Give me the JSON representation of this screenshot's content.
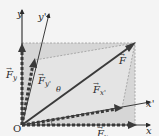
{
  "figure": {
    "origin_label": "O",
    "axes": {
      "x": "x",
      "y": "y",
      "x_prime": "x'",
      "y_prime": "y'"
    },
    "vectors": {
      "F": "F",
      "Fx": {
        "base": "F",
        "sub": "x"
      },
      "Fy": {
        "base": "F",
        "sub": "y"
      },
      "Fx_prime": {
        "base": "F",
        "sub": "x'"
      },
      "Fy_prime": {
        "base": "F",
        "sub": "y'"
      }
    },
    "angle_label": "θ",
    "colors": {
      "background": "#f4f4f4",
      "shaded_region": "#d4d4d4",
      "inner_shade": "#e2e2e2",
      "vector": "#3a3a3a",
      "dashed": "#9a9a9a",
      "text": "#2a2a2a"
    }
  }
}
